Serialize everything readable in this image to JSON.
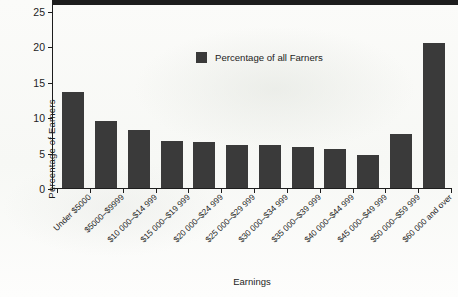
{
  "chart_data": {
    "type": "bar",
    "title": "",
    "xlabel": "Earnings",
    "ylabel": "Percentage of Earners",
    "ylim": [
      0,
      25
    ],
    "yticks": [
      0,
      5,
      10,
      15,
      20,
      25
    ],
    "grid": false,
    "legend_position": "inside-top-center",
    "legend": [
      "Percentage of all Farners"
    ],
    "bar_color": "#3a3a3a",
    "categories": [
      "Under $5000",
      "$5000–$9999",
      "$10 000–$14 999",
      "$15 000–$19 999",
      "$20 000–$24 999",
      "$25 000–$29 999",
      "$30 000–$34 999",
      "$35 000–$39 999",
      "$40 000–$44 999",
      "$45 000–$49 999",
      "$50 000–$59 999",
      "$60 000 and over"
    ],
    "series": [
      {
        "name": "Percentage of all Farners",
        "values": [
          13.6,
          9.5,
          8.2,
          6.6,
          6.5,
          6.1,
          6.1,
          5.8,
          5.5,
          4.6,
          7.6,
          20.5
        ]
      }
    ]
  }
}
